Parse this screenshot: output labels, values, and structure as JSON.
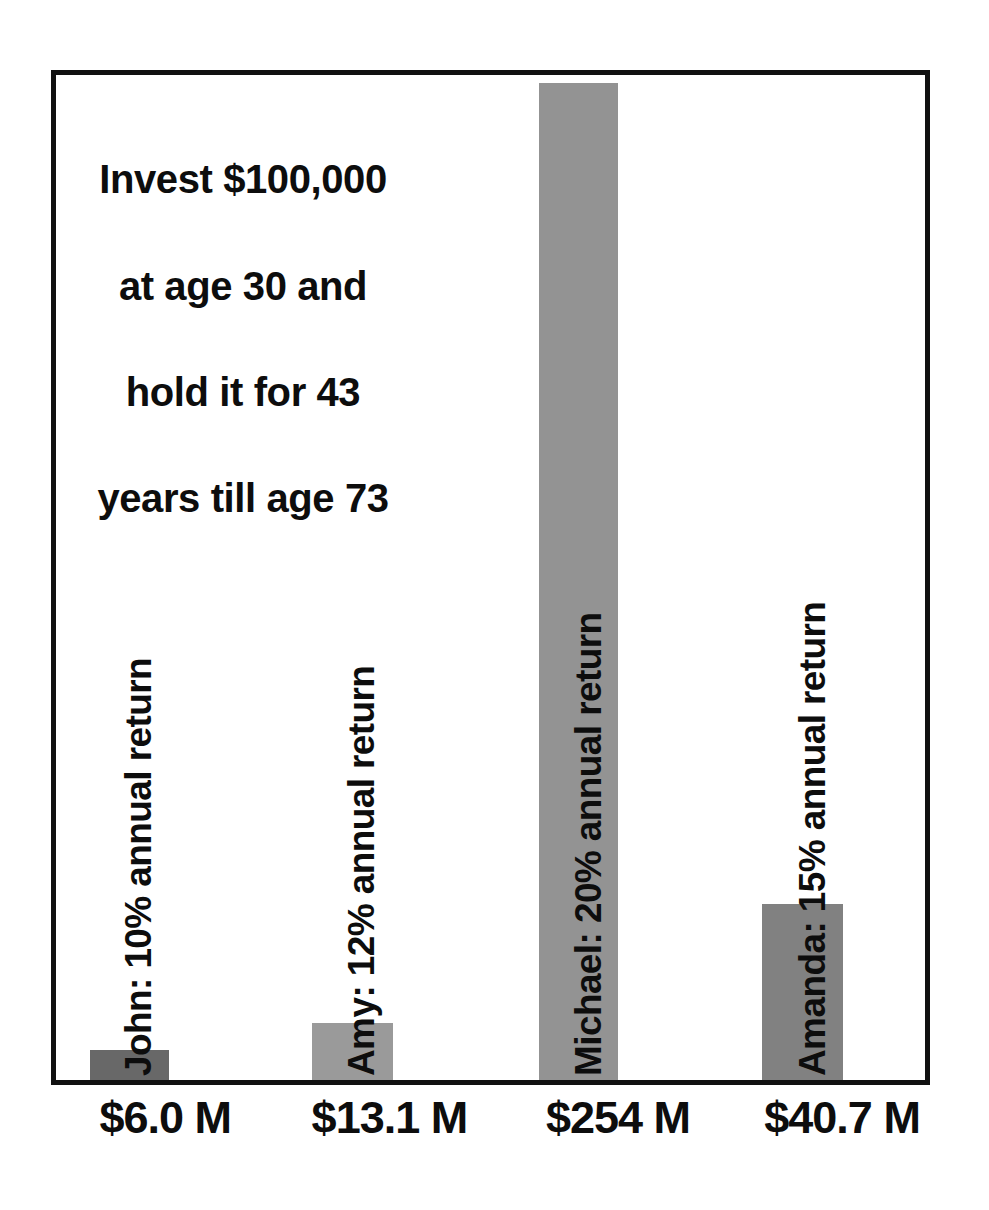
{
  "chart_data": {
    "type": "bar",
    "title": "Invest $100,000 at age 30 and hold it for 43 years till age 73",
    "title_lines": [
      "Invest $100,000",
      "at age 30 and",
      "hold it for 43",
      "years till age 73"
    ],
    "xlabel": "",
    "ylabel": "",
    "ylim": [
      0,
      257
    ],
    "grid": false,
    "legend": "none",
    "units": "millions of USD",
    "categories": [
      "John: 10% annual return",
      "Amy: 12% annual return",
      "Michael: 20% annual return",
      "Amanda: 15% annual return"
    ],
    "values": [
      6.0,
      13.1,
      254,
      40.7
    ],
    "value_labels": [
      "$6.0 M",
      "$13.1 M",
      "$254 M",
      "$40.7 M"
    ],
    "annual_returns": [
      "10%",
      "12%",
      "20%",
      "15%"
    ],
    "investors": [
      "John",
      "Amy",
      "Michael",
      "Amanda"
    ],
    "initial_investment": "$100,000",
    "start_age": 30,
    "end_age": 73,
    "holding_years": 43,
    "bar_colors": [
      "#686868",
      "#9a9a9a",
      "#939393",
      "#818181"
    ],
    "frame_color": "#111111",
    "background_color": "#ffffff",
    "bars": [
      {
        "investor": "John",
        "rate": "10%",
        "series_label": "John: 10% annual return",
        "value": 6.0,
        "value_label": "$6.0 M",
        "color": "#686868",
        "left_pct": 3.9,
        "width_pct": 9.1,
        "height_pct": 2.95,
        "label_left_pct": 12.0,
        "value_label_center_pct": 13.0
      },
      {
        "investor": "Amy",
        "rate": "12%",
        "series_label": "Amy: 12% annual return",
        "value": 13.1,
        "value_label": "$13.1 M",
        "color": "#9a9a9a",
        "left_pct": 29.5,
        "width_pct": 9.3,
        "height_pct": 5.7,
        "label_left_pct": 37.6,
        "value_label_center_pct": 38.5
      },
      {
        "investor": "Michael",
        "rate": "20%",
        "series_label": "Michael: 20% annual return",
        "value": 254,
        "value_label": "$254 M",
        "color": "#939393",
        "left_pct": 55.6,
        "width_pct": 9.1,
        "height_pct": 99.2,
        "label_left_pct": 63.8,
        "value_label_center_pct": 64.5
      },
      {
        "investor": "Amanda",
        "rate": "15%",
        "series_label": "Amanda: 15% annual return",
        "value": 40.7,
        "value_label": "$40.7 M",
        "color": "#818181",
        "left_pct": 81.3,
        "width_pct": 9.3,
        "height_pct": 17.5,
        "label_left_pct": 89.5,
        "value_label_center_pct": 90.0
      }
    ]
  }
}
